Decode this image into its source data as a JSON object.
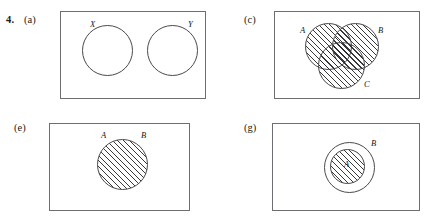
{
  "figure": {
    "number": "4.",
    "panels": [
      {
        "tag": "(a)",
        "name": "panel-a",
        "description": "two disjoint unshaded circles",
        "sets": [
          {
            "label": "X",
            "shaded": false
          },
          {
            "label": "Y",
            "shaded": false
          }
        ]
      },
      {
        "tag": "(c)",
        "name": "panel-c",
        "description": "three overlapping circles, entire union shaded",
        "sets": [
          {
            "label": "A",
            "shaded": true
          },
          {
            "label": "B",
            "shaded": true
          },
          {
            "label": "C",
            "shaded": true
          }
        ]
      },
      {
        "tag": "(e)",
        "name": "panel-e",
        "description": "single shaded circle labelled A and B",
        "sets": [
          {
            "label": "A",
            "shaded": true
          },
          {
            "label": "B",
            "shaded": true
          }
        ]
      },
      {
        "tag": "(g)",
        "name": "panel-g",
        "description": "shaded circle A contained in larger circle B",
        "sets": [
          {
            "label": "A",
            "shaded": true
          },
          {
            "label": "B",
            "shaded": false
          }
        ]
      }
    ]
  },
  "colors": {
    "frame_border": "#6e6e72",
    "circle_stroke": "#4a4a4e",
    "hatch": "#28282c",
    "text": "#15151a",
    "background": "#ffffff"
  }
}
